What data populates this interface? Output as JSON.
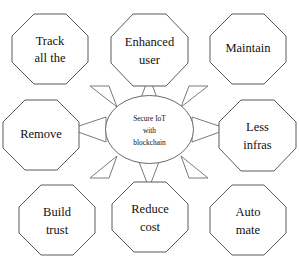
{
  "diagram": {
    "type": "hub-and-spoke",
    "background_color": "#ffffff",
    "stroke_color": "#5b5b5b",
    "text_color": "#111111",
    "hub": {
      "shape": "ellipse",
      "lines": [
        "Secure IoT",
        "with",
        "blockchain"
      ],
      "line1": "Secure IoT",
      "line2": "with",
      "line3": "blockchain"
    },
    "arrow_count": 8,
    "arrow_direction": "outward from hub",
    "nodes": [
      {
        "id": "track-all-the",
        "shape": "octagon",
        "position": "top-left",
        "line1": "Track",
        "line2": "all the"
      },
      {
        "id": "enhanced-user",
        "shape": "octagon",
        "position": "top-center",
        "line1": "Enhanced",
        "line2": "user"
      },
      {
        "id": "maintain",
        "shape": "octagon",
        "position": "top-right",
        "line1": "Maintain",
        "line2": ""
      },
      {
        "id": "remove",
        "shape": "octagon",
        "position": "middle-left",
        "line1": "Remove",
        "line2": ""
      },
      {
        "id": "less-infras",
        "shape": "octagon",
        "position": "middle-right",
        "line1": "Less",
        "line2": "infras"
      },
      {
        "id": "build-trust",
        "shape": "octagon",
        "position": "bottom-left",
        "line1": "Build",
        "line2": "trust"
      },
      {
        "id": "reduce-cost",
        "shape": "octagon",
        "position": "bottom-center",
        "line1": "Reduce",
        "line2": "cost"
      },
      {
        "id": "auto-mate",
        "shape": "octagon",
        "position": "bottom-right",
        "line1": "Auto",
        "line2": "mate"
      }
    ]
  }
}
